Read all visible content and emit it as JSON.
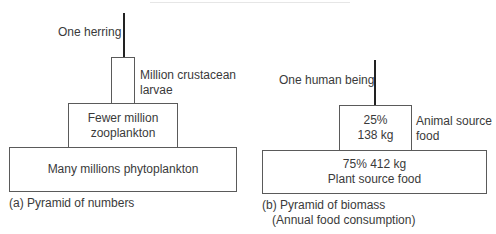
{
  "diagrams": {
    "numbers": {
      "apex_label": "One herring",
      "level2_label_line1": "Million crustacean",
      "level2_label_line2": "larvae",
      "level3_line1": "Fewer million",
      "level3_line2": "zooplankton",
      "base": "Many millions phytoplankton",
      "caption": "(a) Pyramid of numbers"
    },
    "biomass": {
      "apex_label": "One human being",
      "top_pct": "25%",
      "top_kg": "138 kg",
      "top_side_line1": "Animal source",
      "top_side_line2": "food",
      "base_line1": "75% 412 kg",
      "base_line2": "Plant source food",
      "caption_line1": "(b) Pyramid of biomass",
      "caption_line2": "(Annual food consumption)"
    }
  }
}
